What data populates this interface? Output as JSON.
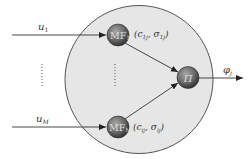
{
  "diagram": {
    "type": "fuzzy-neuron-block",
    "colors": {
      "background": "#ffffff",
      "outer_circle_fill": "#e6e6e6",
      "outer_circle_stroke": "#555555",
      "node_fill_center": "#9a9a9a",
      "node_fill_edge": "#3a3a3a",
      "line": "#333333"
    },
    "inputs": [
      {
        "id": "u1",
        "label_base": "u",
        "label_sub": "1"
      },
      {
        "id": "uM",
        "label_base": "u",
        "label_sub": "M"
      }
    ],
    "input_ellipsis": "⋮",
    "nodes": [
      {
        "id": "mf-top",
        "label_base": "MF",
        "label_sub": "1",
        "params": "(c",
        "params_full": "(c_ij, σ_ij)",
        "param_c_sub": "1j",
        "param_s_sub": "1j"
      },
      {
        "id": "mf-bottom",
        "label_base": "MF",
        "label_sub": "M",
        "params_full": "(c_ij, σ_ij)",
        "param_c_sub": "ij",
        "param_s_sub": "ij"
      },
      {
        "id": "product",
        "label": "Π"
      }
    ],
    "node_ellipsis": "⋮",
    "output": {
      "label_base": "φ",
      "label_sub": "j"
    },
    "text": {
      "u1_base": "u",
      "u1_sub": "1",
      "uM_base": "u",
      "uM_sub": "M",
      "mf_top_label": "MF",
      "mf_top_sub": "1",
      "mf_bottom_label": "MF",
      "mf_bottom_sub": "M",
      "pi_label": "Π",
      "params_top_open": "(c",
      "params_top_c_sub": "1j",
      "params_top_mid": ", σ",
      "params_top_s_sub": "1j",
      "params_top_close": ")",
      "params_bottom_open": "(c",
      "params_bottom_c_sub": "ij",
      "params_bottom_mid": ", σ",
      "params_bottom_s_sub": "ij",
      "params_bottom_close": ")",
      "output_base": "φ",
      "output_sub": "j"
    }
  }
}
